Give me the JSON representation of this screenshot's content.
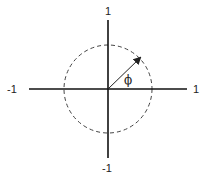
{
  "diagram": {
    "type": "unit-circle-phasor",
    "labels": {
      "y_top": "1",
      "y_bottom": "-1",
      "x_left": "-1",
      "x_right": "1",
      "angle": "ϕ"
    },
    "colors": {
      "axis": "#111111",
      "circle": "#444444",
      "arrow": "#222222"
    }
  }
}
